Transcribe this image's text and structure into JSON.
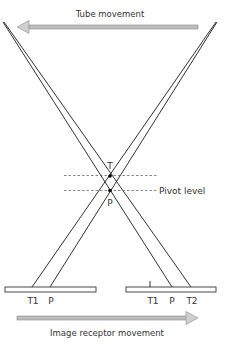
{
  "diagram": {
    "tube_movement_label": "Tube movement",
    "tube_movement_direction": "left",
    "image_receptor_movement_label": "Image receptor movement",
    "image_receptor_movement_direction": "right",
    "pivot_level_label": "Pivot level",
    "focal_points": {
      "upper": "T",
      "lower": "P"
    },
    "left_receptor": {
      "labels": [
        "T1",
        "P"
      ]
    },
    "right_receptor": {
      "labels": [
        "T1",
        "P",
        "T2"
      ]
    },
    "colors": {
      "arrow_fill": "#bdbdbd",
      "arrow_stroke": "#8a8a8a",
      "line": "#1a1a1a",
      "text": "#333333"
    }
  }
}
